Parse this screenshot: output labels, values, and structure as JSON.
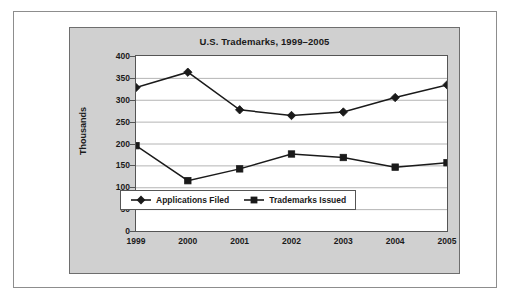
{
  "chart_data": {
    "type": "line",
    "title": "U.S. Trademarks, 1999–2005",
    "xlabel": "",
    "ylabel": "Thousands",
    "categories": [
      "1999",
      "2000",
      "2001",
      "2002",
      "2003",
      "2004",
      "2005"
    ],
    "ylim": [
      0,
      400
    ],
    "yticks": [
      0,
      50,
      100,
      150,
      200,
      250,
      300,
      350,
      400
    ],
    "ytick_labels": [
      "0",
      "50",
      "100",
      "150",
      "200",
      "250",
      "300",
      "350",
      "400"
    ],
    "grid": true,
    "legend_position": "inside-bottom-left",
    "series": [
      {
        "name": "Applications Filed",
        "marker": "diamond",
        "color": "#1a1a1a",
        "values": [
          328,
          363,
          277,
          264,
          272,
          305,
          334
        ]
      },
      {
        "name": "Trademarks Issued",
        "marker": "square",
        "color": "#1a1a1a",
        "values": [
          195,
          115,
          142,
          176,
          168,
          146,
          156
        ]
      }
    ]
  },
  "figure": {
    "panel_background": "#d0d0d0",
    "plot_background": "#ffffff",
    "frame_color": "#8d8d8d",
    "grid_color": "#b4b4b4",
    "axis_color": "#555555",
    "text_color": "#1a1a1a"
  }
}
